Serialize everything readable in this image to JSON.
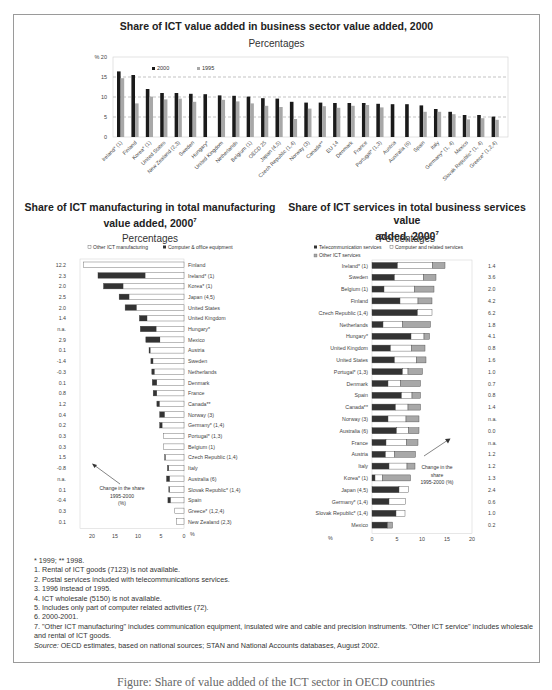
{
  "top_chart": {
    "title": "Share of ICT value added in business sector value added, 2000",
    "subtitle": "Percentages",
    "y_unit": "%",
    "legend": [
      "2000",
      "1995"
    ]
  },
  "left_chart": {
    "title_line1": "Share of ICT manufacturing in total manufacturing",
    "title_line2": "value added, 2000",
    "title_sup": "7",
    "subtitle": "Percentages",
    "legend": [
      "Other ICT manufacturing",
      "Computer & office equipment"
    ],
    "annotation": [
      "Change in the share",
      "1995-2000",
      "(%)"
    ],
    "x_unit": "%"
  },
  "right_chart": {
    "title_line1": "Share of ICT services in total business services value",
    "title_line2": "added, 2000",
    "title_sup": "7",
    "subtitle": "Percentages",
    "legend": [
      "Telecommunication services",
      "Computer and related services",
      "Other ICT services"
    ],
    "annotation": [
      "Change in the",
      "share",
      "1995-2000 (%)"
    ],
    "x_unit": "%"
  },
  "chart_data": [
    {
      "type": "bar",
      "title": "Share of ICT value added in business sector value added, 2000",
      "subtitle": "Percentages",
      "xlabel": "",
      "ylabel": "%",
      "ylim": [
        0,
        20
      ],
      "yticks": [
        0,
        5,
        10,
        15,
        20
      ],
      "grid": "dashed horizontal at 5, 10, 15",
      "legend_position": "top-left inside",
      "categories": [
        "Ireland* (1)",
        "Finland",
        "Korea* (1)",
        "United States",
        "New Zealand (2,3)",
        "Sweden",
        "Hungary*",
        "United Kingdom",
        "Netherlands",
        "Belgium (1)",
        "OECD 25",
        "Japan (4,5)",
        "Czech Republic (1,4)",
        "Norway (3)",
        "Canada**",
        "EU 14",
        "Denmark",
        "France",
        "Portugal* (1,3)",
        "Austria",
        "Australia (6)",
        "Spain",
        "Italy",
        "Germany* (1, 4)",
        "Mexico",
        "Slovak Republic* (1, 4)",
        "Greece* (1,2,4)"
      ],
      "series": [
        {
          "name": "2000",
          "color": "#1a1a1a",
          "values": [
            16.4,
            15.5,
            12.0,
            11.0,
            11.0,
            10.8,
            10.7,
            10.4,
            10.3,
            10.1,
            9.7,
            9.6,
            8.8,
            8.6,
            8.6,
            8.5,
            8.5,
            8.5,
            8.3,
            8.2,
            8.2,
            7.9,
            7.0,
            6.3,
            5.5,
            5.5,
            5.1
          ]
        },
        {
          "name": "1995",
          "color": "#a8a8a8",
          "values": [
            14.7,
            8.4,
            10.1,
            9.4,
            9.6,
            8.8,
            null,
            9.3,
            8.9,
            8.4,
            7.8,
            7.5,
            4.5,
            7.1,
            7.7,
            7.3,
            7.8,
            8.0,
            7.4,
            null,
            null,
            6.3,
            6.3,
            5.7,
            4.4,
            4.7,
            4.3
          ]
        }
      ]
    },
    {
      "type": "bar",
      "orientation": "horizontal-stacked",
      "title": "Share of ICT manufacturing in total manufacturing value added, 2000",
      "subtitle": "Percentages",
      "xlabel": "%",
      "xlim": [
        0,
        20
      ],
      "xticks": [
        20,
        15,
        10,
        5,
        0
      ],
      "x_reversed": true,
      "legend_position": "top",
      "categories": [
        "Finland",
        "Ireland* (1)",
        "Korea* (1)",
        "Japan (4,5)",
        "United States",
        "United Kingdom",
        "Hungary*",
        "Mexico",
        "Austria",
        "Sweden",
        "Netherlands",
        "Denmark",
        "France",
        "Canada**",
        "Norway (3)",
        "Germany* (1,4)",
        "Portugal* (1,3)",
        "Belgium (1)",
        "Czech Republic (1,4)",
        "Italy",
        "Australia (6)",
        "Slovak Republic* (1,4)",
        "Spain",
        "Greece* (1,2,4)",
        "New Zealand (2,3)"
      ],
      "series": [
        {
          "name": "Computer & office equipment",
          "color": "#333333",
          "values": [
            0.0,
            10.3,
            4.3,
            2.2,
            2.5,
            1.7,
            3.5,
            3.1,
            0.3,
            0.5,
            0.6,
            1.0,
            0.8,
            0.6,
            1.1,
            0.6,
            0.0,
            0.0,
            0.2,
            0.3,
            0.7,
            0.2,
            0.6,
            0.0,
            0.0
          ]
        },
        {
          "name": "Other ICT manufacturing",
          "color": "#ffffff",
          "values": [
            21.8,
            8.4,
            13.2,
            11.9,
            10.3,
            8.0,
            6.0,
            5.2,
            7.3,
            6.7,
            6.4,
            5.9,
            5.9,
            5.3,
            4.2,
            4.7,
            4.5,
            4.4,
            4.0,
            3.3,
            3.1,
            3.1,
            2.9,
            2.0,
            1.6
          ]
        }
      ],
      "change_1995_2000": [
        "12.2",
        "2.3",
        "2.0",
        "2.5",
        "2.0",
        "1.4",
        "n.a.",
        "2.9",
        "0.1",
        "-1.4",
        "-0.3",
        "0.1",
        "0.8",
        "1.2",
        "0.4",
        "0.2",
        "0.3",
        "0.3",
        "1.5",
        "-0.8",
        "n.a.",
        "0.1",
        "-0.4",
        "0.3",
        "0.1"
      ]
    },
    {
      "type": "bar",
      "orientation": "horizontal-stacked",
      "title": "Share of ICT services in total business services value added, 2000",
      "subtitle": "Percentages",
      "xlabel": "%",
      "xlim": [
        0,
        20
      ],
      "xticks": [
        0,
        5,
        10,
        15,
        20
      ],
      "legend_position": "top",
      "categories": [
        "Ireland* (1)",
        "Sweden",
        "Belgium (1)",
        "Finland",
        "Czech Republic (1,4)",
        "Netherlands",
        "Hungary*",
        "United Kingdom",
        "United States",
        "Portugal* (1,3)",
        "Denmark",
        "Spain",
        "Canada**",
        "Norway (3)",
        "Australia (6)",
        "France",
        "Austria",
        "Italy",
        "Korea* (1)",
        "Japan (4,5)",
        "Germany* (1,4)",
        "Slovak Republic* (1,4)",
        "Mexico"
      ],
      "series": [
        {
          "name": "Telecommunication services",
          "color": "#333333",
          "values": [
            5.1,
            4.5,
            2.4,
            5.6,
            9.1,
            2.2,
            7.8,
            3.7,
            4.5,
            6.1,
            3.2,
            5.9,
            4.7,
            3.2,
            4.9,
            2.8,
            2.7,
            3.4,
            0.6,
            5.4,
            3.4,
            4.8,
            3.1
          ]
        },
        {
          "name": "Computer and related services",
          "color": "#ffffff",
          "values": [
            7.0,
            5.8,
            6.1,
            3.6,
            2.9,
            3.9,
            2.6,
            4.2,
            4.4,
            1.1,
            2.5,
            2.1,
            2.5,
            3.6,
            2.4,
            4.1,
            1.8,
            3.6,
            1.5,
            1.9,
            3.3,
            1.8,
            0.0
          ]
        },
        {
          "name": "Other ICT services",
          "color": "#a8a8a8",
          "values": [
            2.5,
            2.5,
            3.9,
            2.8,
            0.0,
            5.6,
            1.1,
            2.7,
            1.9,
            2.9,
            4.0,
            1.7,
            2.5,
            2.6,
            2.1,
            2.3,
            4.2,
            1.6,
            5.6,
            0.0,
            0.0,
            0.0,
            1.0
          ]
        }
      ],
      "change_1995_2000": [
        "1.4",
        "3.6",
        "2.0",
        "4.2",
        "6.2",
        "1.8",
        "4.1",
        "0.8",
        "1.6",
        "1.0",
        "0.7",
        "0.8",
        "1.4",
        "n.a.",
        "0.0",
        "n.a.",
        "1.2",
        "1.2",
        "1.3",
        "2.4",
        "0.6",
        "1.0",
        "0.2"
      ]
    }
  ],
  "footnotes": [
    "* 1999; ** 1998.",
    "1. Rental of ICT goods (7123) is not available.",
    "2. Postal services included with telecommunications services.",
    "3. 1996 instead of 1995.",
    "4. ICT wholesale (5150) is not available.",
    "5. Includes only part of computer related activities (72).",
    "6. 2000-2001.",
    "7. \"Other ICT manufacturing\" includes communication equipment, insulated wire and cable and precision instruments. \"Other ICT service\" includes wholesale and rental of ICT goods."
  ],
  "source_label": "Source:",
  "source_text": " OECD estimates, based on national sources; STAN and National Accounts databases, August 2002.",
  "caption": "Figure: Share of value added of the ICT sector in OECD countries"
}
